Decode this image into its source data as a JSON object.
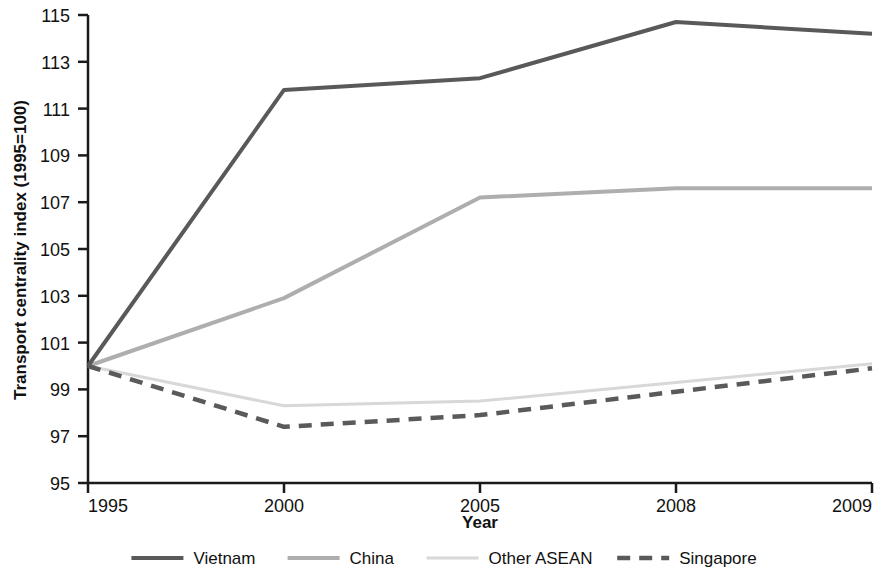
{
  "chart_data": {
    "type": "line",
    "title": "",
    "xlabel": "Year",
    "ylabel": "Transport centrality index (1995=100)",
    "categories": [
      "1995",
      "2000",
      "2005",
      "2008",
      "2009"
    ],
    "x_tick_labels": [
      "1995",
      "2000",
      "2005",
      "2008",
      "2009"
    ],
    "y_tick_labels": [
      "95",
      "97",
      "99",
      "101",
      "103",
      "105",
      "107",
      "109",
      "111",
      "113",
      "115"
    ],
    "y_ticks": [
      95,
      97,
      99,
      101,
      103,
      105,
      107,
      109,
      111,
      113,
      115
    ],
    "ylim": [
      95,
      115
    ],
    "grid": false,
    "legend_position": "bottom",
    "series": [
      {
        "name": "Vietnam",
        "values": [
          100,
          111.8,
          112.3,
          114.7,
          114.2
        ],
        "color": "#595959",
        "style": "solid",
        "width": 4
      },
      {
        "name": "China",
        "values": [
          100,
          102.9,
          107.2,
          107.6,
          107.6
        ],
        "color": "#aeaeae",
        "style": "solid",
        "width": 4
      },
      {
        "name": "Other ASEAN",
        "values": [
          100,
          98.3,
          98.5,
          99.3,
          100.1
        ],
        "color": "#d8d8d8",
        "style": "solid",
        "width": 3
      },
      {
        "name": "Singapore",
        "values": [
          100,
          97.4,
          97.9,
          98.9,
          99.9
        ],
        "color": "#5a5a5a",
        "style": "dashed",
        "width": 4.5
      }
    ]
  },
  "legend": {
    "items": [
      {
        "label": "Vietnam"
      },
      {
        "label": "China"
      },
      {
        "label": "Other ASEAN"
      },
      {
        "label": "Singapore"
      }
    ]
  },
  "axes": {
    "x_title": "Year",
    "y_title": "Transport centrality index (1995=100)"
  }
}
